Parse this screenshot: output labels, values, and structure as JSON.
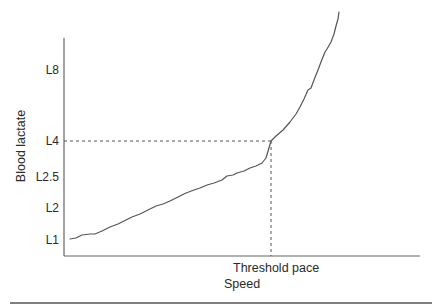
{
  "chart_data": {
    "type": "line",
    "title": "",
    "xlabel": "Speed",
    "ylabel": "Blood lactate",
    "x_annotation": "Threshold pace",
    "y_ticks": [
      {
        "label": "L8",
        "y": 70
      },
      {
        "label": "L4",
        "y": 141
      },
      {
        "label": "L2.5",
        "y": 177
      },
      {
        "label": "L2",
        "y": 208
      },
      {
        "label": "L1",
        "y": 240
      }
    ],
    "threshold": {
      "x": 271,
      "y": 141,
      "y_label": "L4",
      "x_label": "Threshold pace"
    },
    "grid": false,
    "legend": null,
    "series": [
      {
        "name": "Blood lactate curve",
        "color": "#555555",
        "points": [
          [
            70,
            239
          ],
          [
            76,
            238
          ],
          [
            82,
            235
          ],
          [
            90,
            234
          ],
          [
            95,
            234
          ],
          [
            102,
            231
          ],
          [
            110,
            227
          ],
          [
            118,
            224
          ],
          [
            126,
            220
          ],
          [
            132,
            217
          ],
          [
            140,
            214
          ],
          [
            148,
            210
          ],
          [
            156,
            206
          ],
          [
            163,
            204
          ],
          [
            170,
            201
          ],
          [
            178,
            197
          ],
          [
            186,
            193
          ],
          [
            194,
            190
          ],
          [
            200,
            188
          ],
          [
            207,
            185
          ],
          [
            214,
            183
          ],
          [
            222,
            180
          ],
          [
            227,
            176
          ],
          [
            233,
            175
          ],
          [
            237,
            173
          ],
          [
            244,
            171
          ],
          [
            250,
            168
          ],
          [
            256,
            166
          ],
          [
            262,
            163
          ],
          [
            266,
            158
          ],
          [
            271,
            141
          ],
          [
            276,
            136
          ],
          [
            283,
            130
          ],
          [
            290,
            122
          ],
          [
            296,
            114
          ],
          [
            300,
            107
          ],
          [
            304,
            99
          ],
          [
            308,
            90
          ],
          [
            311,
            88
          ],
          [
            314,
            80
          ],
          [
            318,
            70
          ],
          [
            321,
            62
          ],
          [
            325,
            52
          ],
          [
            327,
            49
          ],
          [
            331,
            42
          ],
          [
            334,
            34
          ],
          [
            336,
            26
          ],
          [
            338,
            19
          ],
          [
            339,
            12
          ]
        ]
      }
    ],
    "axes": {
      "origin": [
        64,
        256
      ],
      "y_top": 38,
      "x_right": 420
    }
  },
  "figure": {
    "bottom_rule": {
      "x1": 10,
      "x2": 432,
      "y": 303
    }
  }
}
